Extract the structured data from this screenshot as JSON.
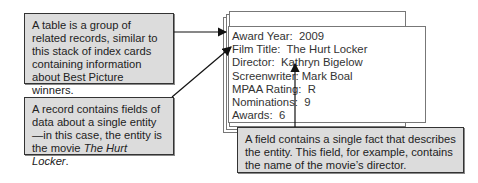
{
  "callouts": {
    "table": "A table is a group of related records, similar to this stack of index cards containing information about Best Picture winners.",
    "record_prefix": "A record contains fields of data about a single entity—in this case, the entity is the movie ",
    "record_movie": "The Hurt Locker",
    "record_suffix": ".",
    "field": "A field contains a single fact that describes the entity. This field, for example, contains the name of the movie’s director."
  },
  "card": {
    "fields": [
      {
        "label": "Award Year:",
        "value": "2009"
      },
      {
        "label": "Film Title:",
        "value": "The Hurt Locker"
      },
      {
        "label": "Director:",
        "value": "Kathryn Bigelow"
      },
      {
        "label": "Screenwriter:",
        "value": "Mark Boal"
      },
      {
        "label": "MPAA Rating:",
        "value": "R"
      },
      {
        "label": "Nominations:",
        "value": "9"
      },
      {
        "label": "Awards:",
        "value": "6"
      }
    ]
  },
  "colors": {
    "callout_bg": "#dcdcdc",
    "border": "#333333"
  }
}
